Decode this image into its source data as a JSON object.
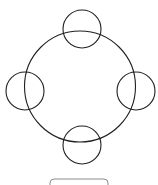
{
  "page": {
    "width": 158,
    "height": 185,
    "background_color": "#ffffff"
  },
  "diagram": {
    "name": "four-node-ring-diagram",
    "stroke_color": "#231f20",
    "stroke_color_light": "#4a4648",
    "fill_color": "none",
    "hub": {
      "label": "",
      "cx": 80,
      "cy": 86.5,
      "r": 55.5,
      "stroke_width": 1.1
    },
    "nodes": [
      {
        "id": "node-top",
        "label": "",
        "position": "top",
        "cx": 82,
        "cy": 29,
        "r": 19,
        "stroke_width": 1.1
      },
      {
        "id": "node-right",
        "label": "",
        "position": "right",
        "cx": 136,
        "cy": 91,
        "r": 19,
        "stroke_width": 1.1
      },
      {
        "id": "node-bottom",
        "label": "",
        "position": "bottom",
        "cx": 82,
        "cy": 145,
        "r": 19,
        "stroke_width": 1.1
      },
      {
        "id": "node-left",
        "label": "",
        "position": "left",
        "cx": 25,
        "cy": 91,
        "r": 19,
        "stroke_width": 1.1
      }
    ]
  },
  "caption_panel": {
    "name": "caption-panel",
    "label": "",
    "x": 50,
    "y": 179,
    "width": 58,
    "height": 14,
    "corner_radius": 4,
    "stroke_color": "#8c8c8c",
    "fill_color": "#ffffff",
    "stroke_width": 1,
    "clipped": true
  }
}
